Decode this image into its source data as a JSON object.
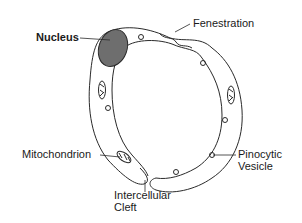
{
  "diagram": {
    "colors": {
      "outline": "#2a2a2a",
      "nucleus": "#6e6e6e",
      "background": "#ffffff"
    },
    "labels": {
      "nucleus": "Nucleus",
      "fenestration": "Fenestration",
      "mitochondrion": "Mitochondrion",
      "intercellular_line1": "Intercellular",
      "intercellular_line2": "Cleft",
      "pinocytic_line1": "Pinocytic",
      "pinocytic_line2": "Vesicle"
    }
  }
}
